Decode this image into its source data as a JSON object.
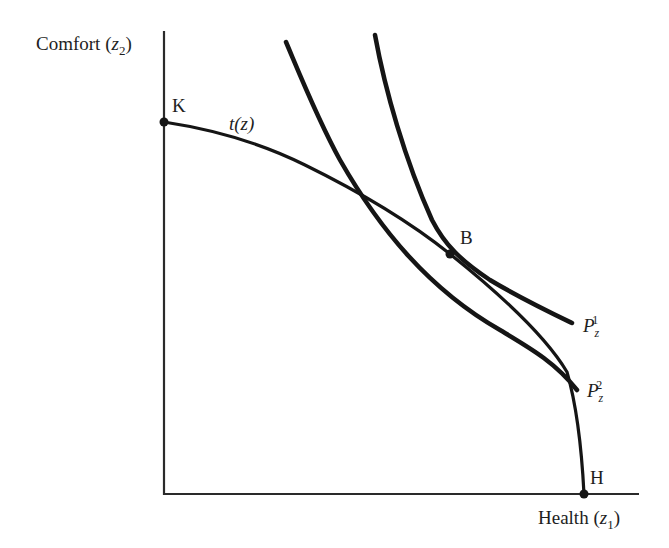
{
  "diagram": {
    "type": "economics-production-possibility-frontier",
    "y_axis": {
      "label_text": "Comfort (",
      "label_var": "z",
      "label_sub": "2",
      "label_close": ")"
    },
    "x_axis": {
      "label_text": "Health (",
      "label_var": "z",
      "label_sub": "1",
      "label_close": ")"
    },
    "points": [
      {
        "id": "K",
        "label": "K",
        "x": 164,
        "y": 122
      },
      {
        "id": "B",
        "label": "B",
        "x": 450,
        "y": 254
      },
      {
        "id": "H",
        "label": "H",
        "x": 584,
        "y": 494
      }
    ],
    "curves": [
      {
        "id": "t",
        "label": "t(z)",
        "description": "transformation / production possibility frontier from K to H"
      },
      {
        "id": "P1",
        "label_main": "P",
        "label_sub": "z",
        "label_sup": "1",
        "description": "price line tangent to frontier at B"
      },
      {
        "id": "P2",
        "label_main": "P",
        "label_sub": "z",
        "label_sup": "2",
        "description": "price line crossing frontier at two points"
      }
    ],
    "colors": {
      "ink": "#151515",
      "background": "#ffffff"
    }
  }
}
